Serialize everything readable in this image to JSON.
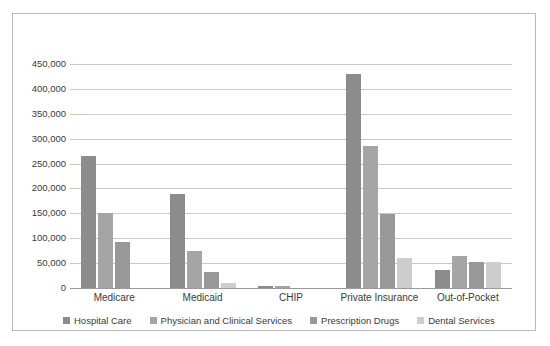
{
  "chart_data": {
    "type": "bar",
    "title": "",
    "subtitle": "",
    "xlabel": "",
    "ylabel": "",
    "categories": [
      "Medicare",
      "Medicaid",
      "CHIP",
      "Private Insurance",
      "Out-of-Pocket"
    ],
    "series": [
      {
        "name": "Hospital Care",
        "color": "#8c8c8c",
        "values": [
          265000,
          188000,
          4000,
          430000,
          37000
        ]
      },
      {
        "name": "Physician and Clinical Services",
        "color": "#a5a5a5",
        "values": [
          150000,
          74000,
          4000,
          286000,
          64000
        ]
      },
      {
        "name": "Prescription Drugs",
        "color": "#989898",
        "values": [
          93000,
          32000,
          0,
          148000,
          53000
        ]
      },
      {
        "name": "Dental Services",
        "color": "#cdcdcd",
        "values": [
          0,
          11000,
          0,
          60000,
          52000
        ]
      }
    ],
    "ylim": [
      0,
      450000
    ],
    "ytick_values": [
      0,
      50000,
      100000,
      150000,
      200000,
      250000,
      300000,
      350000,
      400000,
      450000
    ],
    "ytick_labels": [
      "0",
      "50,000",
      "100,000",
      "150,000",
      "200,000",
      "250,000",
      "300,000",
      "350,000",
      "400,000",
      "450,000"
    ],
    "grid": true,
    "grid_axis": "y",
    "legend_position": "bottom",
    "legend_entries": [
      "Hospital Care",
      "Physician and Clinical Services",
      "Prescription Drugs",
      "Dental Services"
    ],
    "border": true
  }
}
